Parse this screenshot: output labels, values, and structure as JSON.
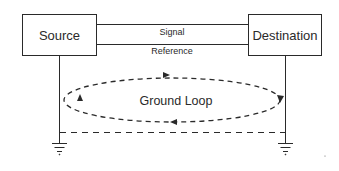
{
  "diagram": {
    "blocks": {
      "source": {
        "label": "Source"
      },
      "destination": {
        "label": "Destination"
      }
    },
    "wires": {
      "signal": {
        "label": "Signal"
      },
      "reference": {
        "label": "Reference"
      }
    },
    "loop": {
      "label": "Ground Loop",
      "style": "dashed",
      "direction": "clockwise"
    },
    "grounds": [
      "source-ground",
      "destination-ground"
    ],
    "ground_connection": {
      "style": "dashed"
    },
    "colors": {
      "stroke": "#2a2a2a",
      "background": "#ffffff"
    }
  }
}
